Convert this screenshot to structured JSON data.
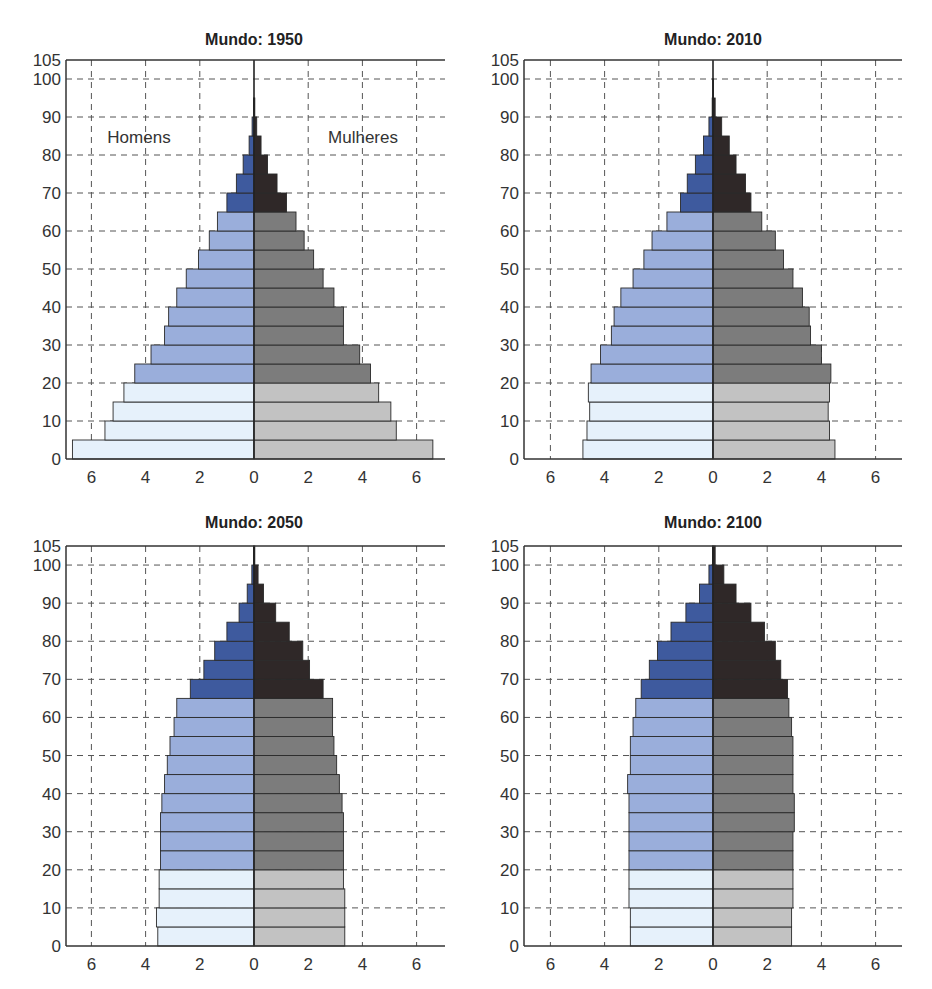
{
  "figure": {
    "colors": {
      "men_young": "#e6f1fb",
      "men_adult": "#9aaedb",
      "men_old": "#3e5a9e",
      "women_young": "#c2c2c2",
      "women_adult": "#7c7c7c",
      "women_old": "#2f2828",
      "grid": "#555555",
      "axis": "#333333",
      "bar_edge": "#2a2a2a"
    },
    "side_labels": {
      "men": "Homens",
      "women": "Mulheres"
    }
  },
  "chart_data": [
    {
      "type": "bar",
      "subtype": "population-pyramid",
      "title": "Mundo: 1950",
      "xlabel": "",
      "ylabel": "",
      "xlim": [
        -7,
        7
      ],
      "ylim": [
        0,
        105
      ],
      "xticks": [
        6,
        4,
        2,
        0,
        2,
        4,
        6
      ],
      "xtick_values": [
        -6,
        -4,
        -2,
        0,
        2,
        4,
        6
      ],
      "yticks": [
        0,
        10,
        20,
        30,
        40,
        50,
        60,
        70,
        80,
        90,
        100,
        105
      ],
      "grid": true,
      "show_side_labels": true,
      "age_groups": [
        "0-4",
        "5-9",
        "10-14",
        "15-19",
        "20-24",
        "25-29",
        "30-34",
        "35-39",
        "40-44",
        "45-49",
        "50-54",
        "55-59",
        "60-64",
        "65-69",
        "70-74",
        "75-79",
        "80-84",
        "85-89",
        "90-94",
        "95-99",
        "100+"
      ],
      "series": [
        {
          "name": "Homens",
          "values": [
            6.7,
            5.5,
            5.2,
            4.8,
            4.4,
            3.8,
            3.3,
            3.15,
            2.85,
            2.5,
            2.05,
            1.65,
            1.35,
            1.0,
            0.65,
            0.4,
            0.18,
            0.07,
            0.02,
            0,
            0
          ]
        },
        {
          "name": "Mulheres",
          "values": [
            6.6,
            5.25,
            5.05,
            4.6,
            4.3,
            3.9,
            3.3,
            3.3,
            2.95,
            2.55,
            2.2,
            1.85,
            1.55,
            1.2,
            0.85,
            0.5,
            0.26,
            0.1,
            0.03,
            0,
            0
          ]
        }
      ]
    },
    {
      "type": "bar",
      "subtype": "population-pyramid",
      "title": "Mundo: 2010",
      "xlabel": "",
      "ylabel": "",
      "xlim": [
        -7,
        7
      ],
      "ylim": [
        0,
        105
      ],
      "xticks": [
        6,
        4,
        2,
        0,
        2,
        4,
        6
      ],
      "xtick_values": [
        -6,
        -4,
        -2,
        0,
        2,
        4,
        6
      ],
      "yticks": [
        0,
        10,
        20,
        30,
        40,
        50,
        60,
        70,
        80,
        90,
        100,
        105
      ],
      "grid": true,
      "show_side_labels": false,
      "age_groups": [
        "0-4",
        "5-9",
        "10-14",
        "15-19",
        "20-24",
        "25-29",
        "30-34",
        "35-39",
        "40-44",
        "45-49",
        "50-54",
        "55-59",
        "60-64",
        "65-69",
        "70-74",
        "75-79",
        "80-84",
        "85-89",
        "90-94",
        "95-99",
        "100+"
      ],
      "series": [
        {
          "name": "Homens",
          "values": [
            4.8,
            4.65,
            4.55,
            4.6,
            4.5,
            4.15,
            3.75,
            3.65,
            3.4,
            2.95,
            2.55,
            2.25,
            1.7,
            1.2,
            0.95,
            0.65,
            0.35,
            0.15,
            0.03,
            0.01,
            0
          ]
        },
        {
          "name": "Mulheres",
          "values": [
            4.5,
            4.3,
            4.25,
            4.3,
            4.35,
            4.0,
            3.6,
            3.55,
            3.3,
            2.95,
            2.6,
            2.3,
            1.8,
            1.4,
            1.2,
            0.85,
            0.6,
            0.32,
            0.08,
            0.02,
            0
          ]
        }
      ]
    },
    {
      "type": "bar",
      "subtype": "population-pyramid",
      "title": "Mundo: 2050",
      "xlabel": "",
      "ylabel": "",
      "xlim": [
        -7,
        7
      ],
      "ylim": [
        0,
        105
      ],
      "xticks": [
        6,
        4,
        2,
        0,
        2,
        4,
        6
      ],
      "xtick_values": [
        -6,
        -4,
        -2,
        0,
        2,
        4,
        6
      ],
      "yticks": [
        0,
        10,
        20,
        30,
        40,
        50,
        60,
        70,
        80,
        90,
        100,
        105
      ],
      "grid": true,
      "show_side_labels": false,
      "age_groups": [
        "0-4",
        "5-9",
        "10-14",
        "15-19",
        "20-24",
        "25-29",
        "30-34",
        "35-39",
        "40-44",
        "45-49",
        "50-54",
        "55-59",
        "60-64",
        "65-69",
        "70-74",
        "75-79",
        "80-84",
        "85-89",
        "90-94",
        "95-99",
        "100+"
      ],
      "series": [
        {
          "name": "Homens",
          "values": [
            3.55,
            3.6,
            3.5,
            3.5,
            3.45,
            3.45,
            3.45,
            3.4,
            3.3,
            3.2,
            3.1,
            2.95,
            2.85,
            2.35,
            1.85,
            1.45,
            1.0,
            0.55,
            0.25,
            0.08,
            0.02
          ]
        },
        {
          "name": "Mulheres",
          "values": [
            3.35,
            3.35,
            3.35,
            3.3,
            3.3,
            3.3,
            3.3,
            3.25,
            3.15,
            3.05,
            2.95,
            2.9,
            2.9,
            2.55,
            2.05,
            1.8,
            1.3,
            0.8,
            0.35,
            0.15,
            0.03
          ]
        }
      ]
    },
    {
      "type": "bar",
      "subtype": "population-pyramid",
      "title": "Mundo: 2100",
      "xlabel": "",
      "ylabel": "",
      "xlim": [
        -7,
        7
      ],
      "ylim": [
        0,
        105
      ],
      "xticks": [
        6,
        4,
        2,
        0,
        2,
        4,
        6
      ],
      "xtick_values": [
        -6,
        -4,
        -2,
        0,
        2,
        4,
        6
      ],
      "yticks": [
        0,
        10,
        20,
        30,
        40,
        50,
        60,
        70,
        80,
        90,
        100,
        105
      ],
      "grid": true,
      "show_side_labels": false,
      "age_groups": [
        "0-4",
        "5-9",
        "10-14",
        "15-19",
        "20-24",
        "25-29",
        "30-34",
        "35-39",
        "40-44",
        "45-49",
        "50-54",
        "55-59",
        "60-64",
        "65-69",
        "70-74",
        "75-79",
        "80-84",
        "85-89",
        "90-94",
        "95-99",
        "100+"
      ],
      "series": [
        {
          "name": "Homens",
          "values": [
            3.05,
            3.05,
            3.1,
            3.1,
            3.1,
            3.1,
            3.1,
            3.1,
            3.15,
            3.05,
            3.05,
            2.95,
            2.85,
            2.65,
            2.35,
            2.05,
            1.55,
            1.0,
            0.5,
            0.15,
            0.02
          ]
        },
        {
          "name": "Mulheres",
          "values": [
            2.9,
            2.9,
            2.95,
            2.95,
            2.95,
            2.95,
            3.0,
            3.0,
            2.95,
            2.95,
            2.95,
            2.9,
            2.8,
            2.75,
            2.5,
            2.3,
            1.9,
            1.4,
            0.85,
            0.4,
            0.08
          ]
        }
      ]
    }
  ]
}
